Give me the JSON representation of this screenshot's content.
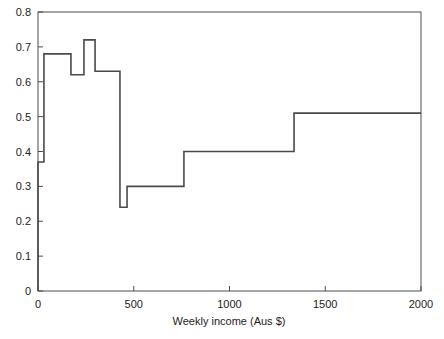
{
  "chart_data": {
    "type": "line",
    "title": "",
    "xlabel": "Weekly income (Aus $)",
    "ylabel": "",
    "xlim": [
      0,
      2000
    ],
    "ylim": [
      0,
      0.8
    ],
    "xticks": [
      0,
      500,
      1000,
      1500,
      2000
    ],
    "xtick_labels": [
      "0",
      "500",
      "1000",
      "1500",
      "2000"
    ],
    "yticks": [
      0,
      0.1,
      0.2,
      0.3,
      0.4,
      0.5,
      0.6,
      0.7,
      0.8
    ],
    "ytick_labels": [
      "0",
      "0.1",
      "0.2",
      "0.3",
      "0.4",
      "0.5",
      "0.6",
      "0.7",
      "0.8"
    ],
    "grid": false,
    "legend": null,
    "step_style": "post",
    "series": [
      {
        "name": "proportion",
        "breakpoints": [
          0,
          31,
          172,
          240,
          298,
          428,
          465,
          762,
          1337,
          2000
        ],
        "values": [
          0.37,
          0.68,
          0.62,
          0.72,
          0.63,
          0.24,
          0.3,
          0.4,
          0.51
        ]
      }
    ],
    "segments": [
      {
        "x_start": 0,
        "x_end": 31,
        "y": 0.37
      },
      {
        "x_start": 31,
        "x_end": 172,
        "y": 0.68
      },
      {
        "x_start": 172,
        "x_end": 240,
        "y": 0.62
      },
      {
        "x_start": 240,
        "x_end": 298,
        "y": 0.72
      },
      {
        "x_start": 298,
        "x_end": 428,
        "y": 0.63
      },
      {
        "x_start": 428,
        "x_end": 465,
        "y": 0.24
      },
      {
        "x_start": 465,
        "x_end": 762,
        "y": 0.3
      },
      {
        "x_start": 762,
        "x_end": 1337,
        "y": 0.4
      },
      {
        "x_start": 1337,
        "x_end": 2000,
        "y": 0.51
      }
    ],
    "colors": {
      "line": "#4a4a4a",
      "frame": "#4d4d4d",
      "background": "#ffffff",
      "text": "#222222"
    }
  }
}
